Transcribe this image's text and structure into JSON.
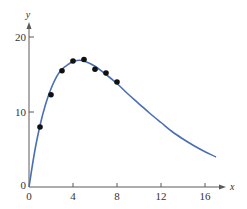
{
  "chart_data": {
    "type": "scatter",
    "title": "",
    "xlabel": "x",
    "ylabel": "y",
    "xlim": [
      0,
      18
    ],
    "ylim": [
      0,
      22
    ],
    "grid": false,
    "legend": null,
    "x_ticks": [
      0,
      4,
      8,
      12,
      16
    ],
    "y_ticks": [
      0,
      10,
      20
    ],
    "x_tick_labels": [
      "0",
      "4",
      "8",
      "12",
      "16"
    ],
    "y_tick_labels": [
      "0",
      "10",
      "20"
    ],
    "series": [
      {
        "name": "data points",
        "kind": "scatter",
        "color": "#111111",
        "x": [
          1,
          2,
          3,
          4,
          5,
          6,
          7,
          8
        ],
        "y": [
          8.0,
          12.3,
          15.5,
          16.8,
          17.0,
          15.7,
          15.2,
          14.0
        ]
      },
      {
        "name": "fitted curve",
        "kind": "line",
        "color": "#4a6fb5",
        "x": [
          0,
          0.5,
          1,
          1.5,
          2,
          2.5,
          3,
          3.5,
          4,
          4.5,
          5,
          6,
          7,
          8,
          9,
          10,
          11,
          12,
          13,
          14,
          15,
          16,
          17
        ],
        "y": [
          0,
          4.6,
          8.2,
          11.0,
          13.1,
          14.7,
          15.7,
          16.3,
          16.7,
          16.9,
          16.8,
          16.1,
          15.0,
          13.8,
          12.4,
          11.1,
          9.8,
          8.6,
          7.4,
          6.4,
          5.5,
          4.7,
          4.0
        ]
      }
    ]
  },
  "axes": {
    "x_label": "x",
    "y_label": "y",
    "origin_label": "0"
  }
}
